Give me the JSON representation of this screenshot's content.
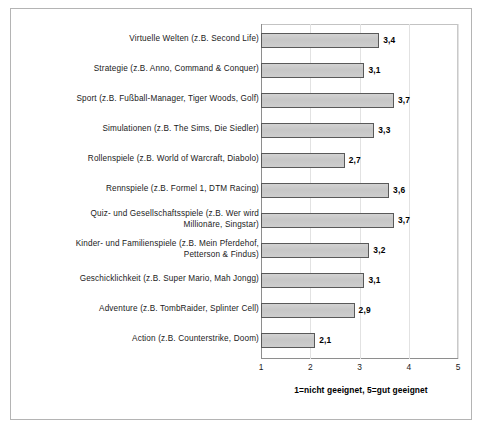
{
  "chart_data": {
    "type": "bar",
    "orientation": "horizontal",
    "title": "",
    "subtitle": "",
    "xlabel": "1=nicht geeignet, 5=gut geeignet",
    "ylabel": "",
    "xlim": [
      1,
      5
    ],
    "xticks": [
      "1",
      "2",
      "3",
      "4",
      "5"
    ],
    "grid": true,
    "legend": null,
    "value_label_format": "german-decimal-comma",
    "categories": [
      "Virtuelle Welten (z.B. Second Life)",
      "Strategie (z.B. Anno, Command & Conquer)",
      "Sport (z.B. Fußball-Manager, Tiger Woods, Golf)",
      "Simulationen (z.B. The Sims, Die Siedler)",
      "Rollenspiele (z.B. World of Warcraft, Diabolo)",
      "Rennspiele (z.B. Formel 1, DTM Racing)",
      "Quiz- und Gesellschaftsspiele (z.B. Wer wird Millionäre, Singstar)",
      "Kinder- und Familienspiele (z.B. Mein Pferdehof, Petterson & Findus)",
      "Geschicklichkeit (z.B. Super Mario, Mah Jongg)",
      "Adventure (z.B. TombRaider, Splinter Cell)",
      "Action (z.B. Counterstrike, Doom)"
    ],
    "category_lines": [
      [
        "Virtuelle Welten (z.B. Second Life)"
      ],
      [
        "Strategie (z.B. Anno, Command & Conquer)"
      ],
      [
        "Sport (z.B. Fußball-Manager, Tiger Woods, Golf)"
      ],
      [
        "Simulationen (z.B. The Sims, Die Siedler)"
      ],
      [
        "Rollenspiele (z.B. World of Warcraft, Diabolo)"
      ],
      [
        "Rennspiele (z.B. Formel 1, DTM Racing)"
      ],
      [
        "Quiz- und Gesellschaftsspiele (z.B. Wer wird",
        "Millionäre, Singstar)"
      ],
      [
        "Kinder- und Familienspiele (z.B. Mein Pferdehof,",
        "Petterson & Findus)"
      ],
      [
        "Geschicklichkeit (z.B. Super Mario, Mah Jongg)"
      ],
      [
        "Adventure (z.B. TombRaider, Splinter Cell)"
      ],
      [
        "Action (z.B. Counterstrike, Doom)"
      ]
    ],
    "values": [
      3.4,
      3.1,
      3.7,
      3.3,
      2.7,
      3.6,
      3.7,
      3.2,
      3.1,
      2.9,
      2.1
    ],
    "value_labels": [
      "3,4",
      "3,1",
      "3,7",
      "3,3",
      "2,7",
      "3,6",
      "3,7",
      "3,2",
      "3,1",
      "2,9",
      "2,1"
    ]
  },
  "style": {
    "bar_fill": "#c9c9c9",
    "bar_border": "#595959",
    "plot_border": "#c3c3c3",
    "axis_color": "#8e8e8e",
    "gridline_color": "#e2e2e2",
    "frame_color": "#b4b4b4",
    "text_color": "#1a1a1a",
    "background": "#ffffff"
  }
}
